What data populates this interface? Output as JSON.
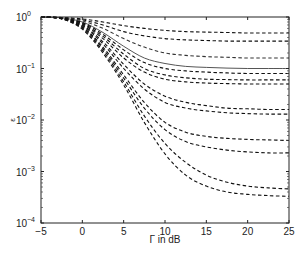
{
  "chart_data": {
    "type": "line",
    "title": "",
    "xlabel": "Γ in dB",
    "ylabel": "ε",
    "xlim": [
      -5,
      25
    ],
    "ylim": [
      0.0001,
      1
    ],
    "yscale": "log",
    "grid": false,
    "legend": null,
    "x_ticks": [
      "-5",
      "0",
      "5",
      "10",
      "15",
      "20",
      "25"
    ],
    "y_ticks": [
      {
        "base": "10",
        "exp": "0"
      },
      {
        "base": "10",
        "exp": "-1"
      },
      {
        "base": "10",
        "exp": "-2"
      },
      {
        "base": "10",
        "exp": "-3"
      },
      {
        "base": "10",
        "exp": "-4"
      }
    ],
    "x": [
      -5,
      -2.5,
      0,
      2.5,
      5,
      7.5,
      10,
      12.5,
      15,
      17.5,
      20,
      22.5,
      25
    ],
    "series": [
      {
        "name": "curve-1",
        "style": "dashed",
        "color": "#111111",
        "values": [
          1.0,
          0.98,
          0.92,
          0.8,
          0.68,
          0.6,
          0.55,
          0.52,
          0.51,
          0.5,
          0.49,
          0.49,
          0.49
        ]
      },
      {
        "name": "curve-2",
        "style": "dashed",
        "color": "#111111",
        "values": [
          1.0,
          0.97,
          0.88,
          0.7,
          0.52,
          0.43,
          0.38,
          0.36,
          0.35,
          0.34,
          0.34,
          0.34,
          0.34
        ]
      },
      {
        "name": "curve-3",
        "style": "dashed",
        "color": "#333333",
        "values": [
          1.0,
          0.97,
          0.84,
          0.6,
          0.38,
          0.26,
          0.2,
          0.18,
          0.17,
          0.165,
          0.16,
          0.16,
          0.16
        ]
      },
      {
        "name": "curve-4-solid",
        "style": "solid",
        "color": "#555555",
        "values": [
          1.0,
          0.96,
          0.8,
          0.5,
          0.27,
          0.16,
          0.125,
          0.11,
          0.105,
          0.102,
          0.1,
          0.1,
          0.1
        ]
      },
      {
        "name": "curve-5",
        "style": "dashed",
        "color": "#111111",
        "values": [
          1.0,
          0.96,
          0.78,
          0.46,
          0.23,
          0.13,
          0.1,
          0.09,
          0.085,
          0.082,
          0.08,
          0.08,
          0.08
        ]
      },
      {
        "name": "curve-6",
        "style": "dashed",
        "color": "#111111",
        "values": [
          1.0,
          0.95,
          0.75,
          0.42,
          0.19,
          0.1,
          0.075,
          0.066,
          0.062,
          0.061,
          0.06,
          0.06,
          0.06
        ]
      },
      {
        "name": "curve-7",
        "style": "dashed",
        "color": "#111111",
        "values": [
          1.0,
          0.95,
          0.73,
          0.38,
          0.16,
          0.085,
          0.062,
          0.055,
          0.052,
          0.051,
          0.05,
          0.05,
          0.05
        ]
      },
      {
        "name": "curve-8",
        "style": "dashed",
        "color": "#111111",
        "values": [
          1.0,
          0.94,
          0.7,
          0.33,
          0.12,
          0.05,
          0.029,
          0.022,
          0.019,
          0.017,
          0.0165,
          0.016,
          0.016
        ]
      },
      {
        "name": "curve-9",
        "style": "dashed",
        "color": "#111111",
        "values": [
          1.0,
          0.94,
          0.68,
          0.3,
          0.1,
          0.04,
          0.022,
          0.017,
          0.015,
          0.0138,
          0.0133,
          0.013,
          0.013
        ]
      },
      {
        "name": "curve-10",
        "style": "dashed",
        "color": "#111111",
        "values": [
          1.0,
          0.93,
          0.65,
          0.26,
          0.075,
          0.022,
          0.009,
          0.0058,
          0.0048,
          0.0044,
          0.0042,
          0.0041,
          0.004
        ]
      },
      {
        "name": "curve-11",
        "style": "dashed",
        "color": "#111111",
        "values": [
          1.0,
          0.93,
          0.63,
          0.24,
          0.065,
          0.017,
          0.0065,
          0.0038,
          0.003,
          0.0026,
          0.0024,
          0.0023,
          0.0023
        ]
      },
      {
        "name": "curve-12",
        "style": "dashed",
        "color": "#111111",
        "values": [
          1.0,
          0.92,
          0.6,
          0.22,
          0.055,
          0.012,
          0.0035,
          0.0015,
          0.00085,
          0.00062,
          0.00052,
          0.00048,
          0.00046
        ]
      },
      {
        "name": "curve-13",
        "style": "dashed",
        "color": "#111111",
        "values": [
          1.0,
          0.92,
          0.58,
          0.2,
          0.048,
          0.009,
          0.0022,
          0.00085,
          0.00052,
          0.0004,
          0.00036,
          0.00034,
          0.00033
        ]
      }
    ]
  }
}
